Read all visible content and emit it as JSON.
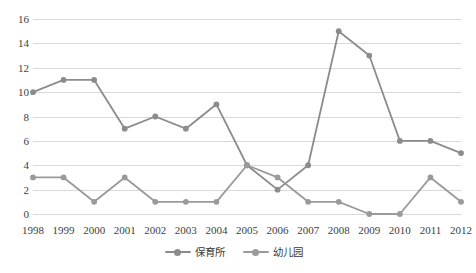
{
  "chart_data": {
    "type": "line",
    "title": "",
    "subtitle": "",
    "xlabel": "",
    "ylabel": "",
    "categories": [
      "1998",
      "1999",
      "2000",
      "2001",
      "2002",
      "2003",
      "2004",
      "2005",
      "2006",
      "2007",
      "2008",
      "2009",
      "2010",
      "2011",
      "2012"
    ],
    "series": [
      {
        "name": "保育所",
        "color": "#8c8c8c",
        "marker": "circle",
        "values": [
          10,
          11,
          11,
          7,
          8,
          7,
          9,
          4,
          2,
          4,
          15,
          13,
          6,
          6,
          5
        ]
      },
      {
        "name": "幼儿园",
        "color": "#9a9a9a",
        "marker": "circle",
        "values": [
          3,
          3,
          1,
          3,
          1,
          1,
          1,
          4,
          3,
          1,
          1,
          0,
          0,
          3,
          1
        ]
      }
    ],
    "yticks": [
      0,
      2,
      4,
      6,
      8,
      10,
      12,
      14,
      16
    ],
    "ytick_labels": [
      "0",
      "2",
      "4",
      "6",
      "8",
      "10",
      "12",
      "14",
      "16"
    ],
    "ylim": [
      0,
      16
    ],
    "xlim": [
      "1998",
      "2012"
    ],
    "grid": true,
    "grid_axis": "y",
    "grid_color": "#d9d9d9",
    "legend_position": "bottom-center",
    "background": "#ffffff"
  },
  "legend": {
    "items": [
      {
        "label": "保育所",
        "color": "#8c8c8c"
      },
      {
        "label": "幼儿园",
        "color": "#9a9a9a"
      }
    ]
  }
}
